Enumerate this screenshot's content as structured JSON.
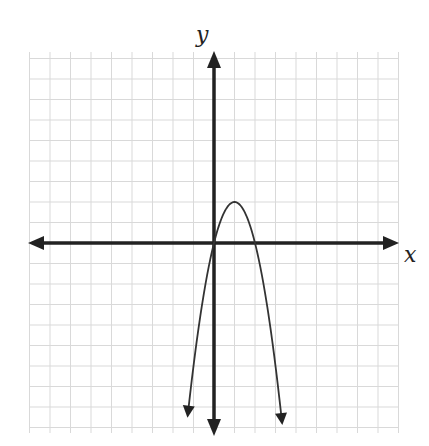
{
  "chart_data": {
    "type": "line",
    "title": "",
    "xlabel": "x",
    "ylabel": "y",
    "grid": true,
    "xlim": [
      -9,
      9
    ],
    "ylim": [
      -9,
      9
    ],
    "tick_labels": "none",
    "series": [
      {
        "name": "parabola",
        "equation": "y = -2x^2 + 4x",
        "vertex": [
          1,
          2
        ],
        "x_intercepts": [
          0,
          2
        ],
        "y_intercept": 0,
        "opens": "down",
        "x": [
          -1.3,
          -1,
          0,
          0.5,
          1,
          1.5,
          2,
          3,
          3.4
        ],
        "values": [
          -8.58,
          -6,
          0,
          1.5,
          2,
          1.5,
          0,
          -6,
          -9.52
        ]
      }
    ]
  },
  "labels": {
    "x_axis": "x",
    "y_axis": "y"
  },
  "colors": {
    "grid": "#d9d9d9",
    "axis": "#222222",
    "curve": "#333333"
  }
}
